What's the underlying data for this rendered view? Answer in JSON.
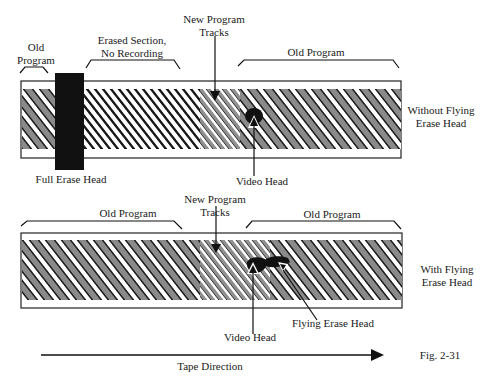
{
  "figure": {
    "caption": "Fig. 2-31",
    "tape_direction_label": "Tape Direction"
  },
  "top_panel": {
    "title_line1": "Without Flying",
    "title_line2": "Erase Head",
    "brackets": {
      "old_program_left_line1": "Old",
      "old_program_left_line2": "Program",
      "erased_line1": "Erased Section,",
      "erased_line2": "No Recording",
      "old_program_right": "Old Program"
    },
    "new_tracks_line1": "New Program",
    "new_tracks_line2": "Tracks",
    "full_erase_head": "Full Erase Head",
    "video_head": "Video Head"
  },
  "bottom_panel": {
    "title_line1": "With Flying",
    "title_line2": "Erase Head",
    "brackets": {
      "old_program_left": "Old Program",
      "old_program_right": "Old Program"
    },
    "new_tracks_line1": "New Program",
    "new_tracks_line2": "Tracks",
    "video_head": "Video Head",
    "flying_erase_head": "Flying Erase Head"
  },
  "colors": {
    "ink": "#111111",
    "track_grey": "#8a8a8a",
    "tape_bg": "#ffffff"
  }
}
